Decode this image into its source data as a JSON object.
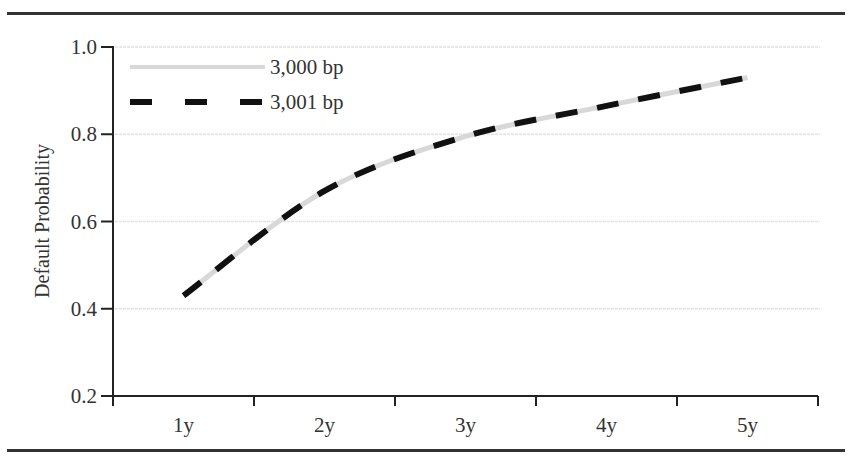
{
  "chart_data": {
    "type": "line",
    "title": "",
    "xlabel": "",
    "ylabel": "Default Probability",
    "categories": [
      "1y",
      "2y",
      "3y",
      "4y",
      "5y"
    ],
    "ylim": [
      0.2,
      1.0
    ],
    "yticks": [
      "0.2",
      "0.4",
      "0.6",
      "0.8",
      "1.0"
    ],
    "grid": true,
    "legend_position": "top-left",
    "series": [
      {
        "name": "3,000 bp",
        "style": "solid-light-gray",
        "color": "#d8d8d8",
        "values": [
          0.43,
          0.67,
          0.795,
          0.865,
          0.93
        ]
      },
      {
        "name": "3,001 bp",
        "style": "dashed-black",
        "color": "#111111",
        "values": [
          0.43,
          0.67,
          0.795,
          0.865,
          0.93
        ]
      }
    ]
  }
}
